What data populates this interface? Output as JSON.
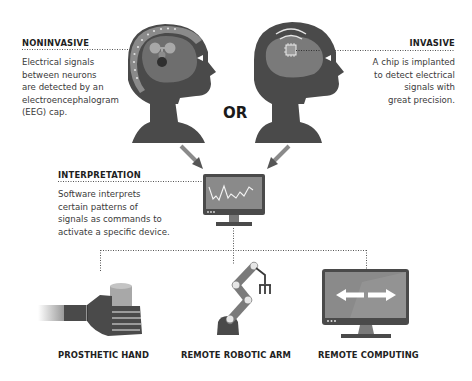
{
  "diagram": {
    "noninvasive": {
      "heading": "NONINVASIVE",
      "lines": [
        "Electrical signals",
        "between neurons",
        "are detected by an",
        "electroencephalogram",
        "(EEG) cap."
      ]
    },
    "invasive": {
      "heading": "INVASIVE",
      "lines": [
        "A chip is implanted",
        "to detect electrical",
        "signals with",
        "great precision."
      ]
    },
    "or_label": "OR",
    "interpretation": {
      "heading": "INTERPRETATION",
      "lines": [
        "Software interprets",
        "certain patterns of",
        "signals as commands to",
        "activate a specific device."
      ]
    },
    "outputs": [
      {
        "label": "PROSTHETIC HAND",
        "icon": "prosthetic-hand-icon"
      },
      {
        "label": "REMOTE ROBOTIC ARM",
        "icon": "robotic-arm-icon"
      },
      {
        "label": "REMOTE COMPUTING",
        "icon": "computer-monitor-icon"
      }
    ],
    "colors": {
      "head_dark": "#4a4a4a",
      "brain_mid": "#6e6e6e",
      "cap_light": "#8a8a8a",
      "node_light": "#b0b0b0",
      "screen": "#8c8c8c",
      "line": "#555555"
    }
  }
}
